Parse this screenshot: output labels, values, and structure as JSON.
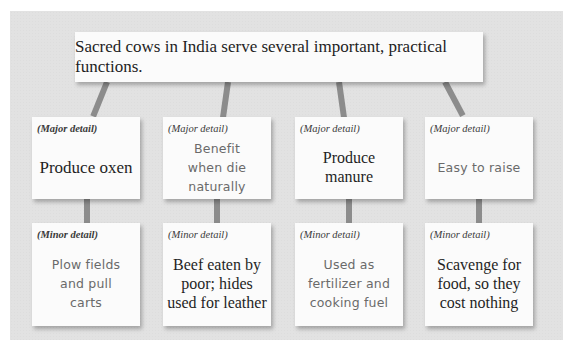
{
  "diagram": {
    "type": "hierarchy",
    "topic": "Sacred cows in India serve several important, practical functions.",
    "major_label": "(Major detail)",
    "minor_label": "(Minor detail)",
    "branches": [
      {
        "major": "Produce oxen",
        "minor": "Plow fields and pull carts",
        "major_style": "serif",
        "minor_style": "hand"
      },
      {
        "major": "Benefit when die naturally",
        "minor": "Beef eaten by poor; hides used for leather",
        "major_style": "hand",
        "minor_style": "serif"
      },
      {
        "major": "Produce manure",
        "minor": "Used as fertilizer and cooking fuel",
        "major_style": "serif",
        "minor_style": "hand"
      },
      {
        "major": "Easy to raise",
        "minor": "Scavenge for food, so they cost nothing",
        "major_style": "hand",
        "minor_style": "serif"
      }
    ]
  },
  "colors": {
    "panel_bg": "#e2e2e2",
    "card_bg": "#fbfbfb",
    "connector": "#8c8c8c",
    "serif_text": "#1f1f1f",
    "hand_text": "#6a6a6a"
  }
}
